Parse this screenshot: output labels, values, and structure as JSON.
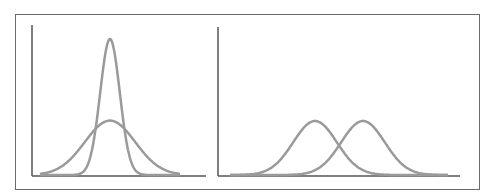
{
  "chart_data": [
    {
      "type": "line",
      "title": "",
      "xlabel": "",
      "ylabel": "",
      "description": "Two normal distributions with the same mean but different spreads",
      "series": [
        {
          "name": "narrow",
          "mean": 0.5,
          "std": 0.07,
          "relative_peak": 1.0
        },
        {
          "name": "wide",
          "mean": 0.5,
          "std": 0.18,
          "relative_peak": 0.4
        }
      ],
      "grid": false,
      "legend": "none"
    },
    {
      "type": "line",
      "title": "",
      "xlabel": "",
      "ylabel": "",
      "description": "Two normal distributions with equal spread and different means",
      "series": [
        {
          "name": "left",
          "mean": 0.39,
          "std": 0.1,
          "relative_peak": 0.4
        },
        {
          "name": "right",
          "mean": 0.61,
          "std": 0.1,
          "relative_peak": 0.4
        }
      ],
      "grid": false,
      "legend": "none"
    }
  ],
  "colors": {
    "curve": "#9a9a9a",
    "axis": "#555555",
    "frame": "#6a6a6a"
  }
}
